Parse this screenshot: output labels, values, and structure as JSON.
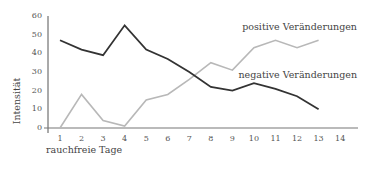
{
  "chart_data": {
    "type": "line",
    "title": "",
    "xlabel": "rauchfreie Tage",
    "ylabel": "Intensität",
    "x": [
      1,
      2,
      3,
      4,
      5,
      6,
      7,
      8,
      9,
      10,
      11,
      12,
      13
    ],
    "x_ticks": [
      "1",
      "2",
      "3",
      "4",
      "5",
      "6",
      "7",
      "8",
      "9",
      "10",
      "11",
      "12",
      "13",
      "14"
    ],
    "y_ticks": [
      "0",
      "10",
      "20",
      "30",
      "40",
      "50",
      "60"
    ],
    "xlim": [
      1,
      14
    ],
    "ylim": [
      0,
      60
    ],
    "grid": false,
    "legend_position": "inline labels at right",
    "series": [
      {
        "name": "positive Veränderungen",
        "color": "#b8b8b8",
        "values": [
          0,
          18,
          4,
          1,
          15,
          18,
          26,
          35,
          31,
          43,
          47,
          43,
          47
        ]
      },
      {
        "name": "negative Veränderungen",
        "color": "#333333",
        "values": [
          47,
          42,
          39,
          55,
          42,
          37,
          30,
          22,
          20,
          24,
          21,
          17,
          10
        ]
      }
    ]
  }
}
